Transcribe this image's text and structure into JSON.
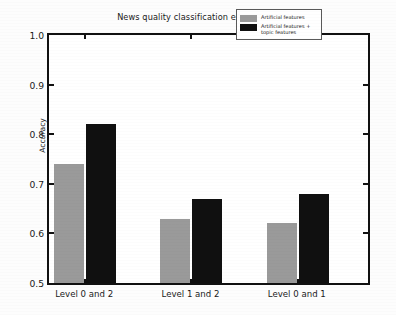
{
  "chart_data": {
    "type": "bar",
    "title": "News quality classification experiment",
    "xlabel": "",
    "ylabel": "Accuracy",
    "categories": [
      "Level 0 and 2",
      "Level 1 and 2",
      "Level 0 and 1"
    ],
    "series": [
      {
        "name": "Artificial features",
        "color": "#9a9a9a",
        "values": [
          0.74,
          0.63,
          0.62
        ]
      },
      {
        "name": "Artificial features + topic features",
        "color": "#101010",
        "values": [
          0.82,
          0.67,
          0.68
        ]
      }
    ],
    "ylim": [
      0.5,
      1.0
    ],
    "yticks": [
      0.5,
      0.6,
      0.7,
      0.8,
      0.9,
      1.0
    ],
    "ytick_labels": [
      "0.5",
      "0.6",
      "0.7",
      "0.8",
      "0.9",
      "1.0"
    ],
    "grid": false,
    "legend_position": "upper right",
    "legend_entries": [
      {
        "label_line1": "Artificial features",
        "label_line2": ""
      },
      {
        "label_line1": "Artificial features +",
        "label_line2": "topic features"
      }
    ]
  },
  "colors": {
    "series_a": "#9a9a9a",
    "series_b": "#101010",
    "axis": "#111111",
    "text": "#1a1a1a",
    "background": "#fdfdfd"
  }
}
